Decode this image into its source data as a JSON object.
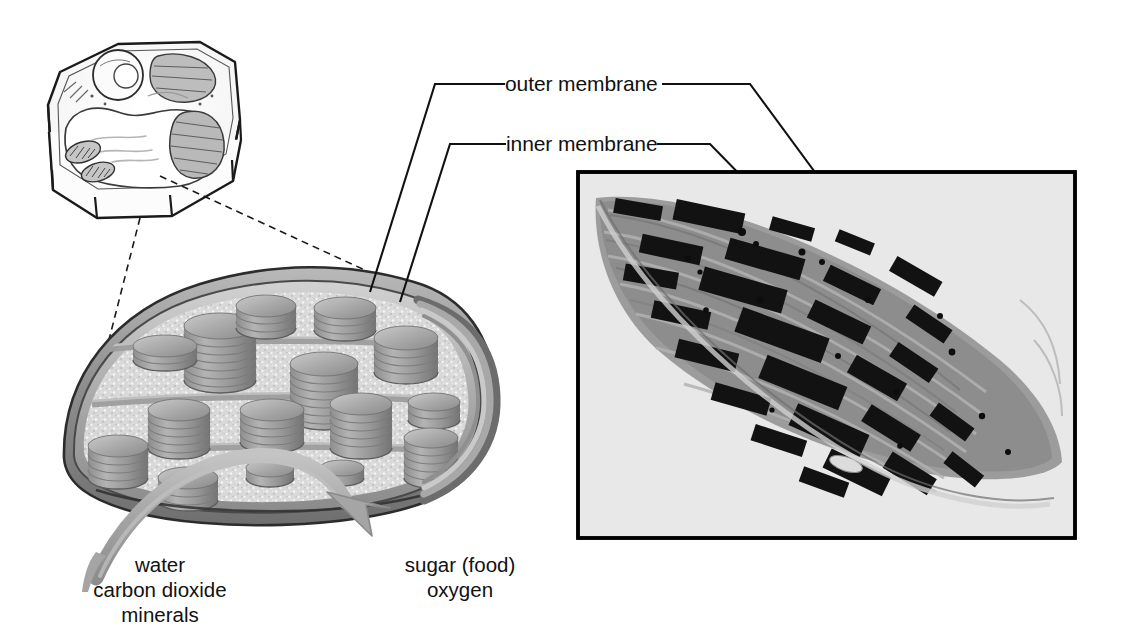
{
  "figure": {
    "type": "biology-diagram"
  },
  "labels": {
    "outer_membrane": "outer membrane",
    "inner_membrane": "inner membrane"
  },
  "inputs": {
    "caption_lines": [
      "water",
      "carbon dioxide",
      "minerals"
    ],
    "line1": "water",
    "line2": "carbon dioxide",
    "line3": "minerals"
  },
  "outputs": {
    "caption_lines": [
      "sugar (food)",
      "oxygen"
    ],
    "line1": "sugar (food)",
    "line2": "oxygen"
  },
  "panels": {
    "cell_drawing": {
      "name": "plant-cell-line-drawing",
      "description": "line drawing of a plant cell showing nucleus, large vacuole, chloroplasts and mitochondria"
    },
    "chloroplast_illustration": {
      "name": "chloroplast-cutaway-illustration",
      "description": "cutaway illustration of a chloroplast showing grana stacks, stroma, lamellae and the double membrane"
    },
    "micrograph": {
      "name": "chloroplast-electron-micrograph",
      "description": "transmission electron micrograph of a chloroplast with dark grana stacks"
    }
  },
  "colors": {
    "ink": "#111111",
    "membrane_gray": "#8e8e8e",
    "stroma_gray": "#cfcfcf",
    "grana_gray": "#9a9a9a",
    "arrow_gray": "#a9a9a9",
    "micrograph_bg": "#e8e8e8",
    "micrograph_border": "#000000"
  }
}
